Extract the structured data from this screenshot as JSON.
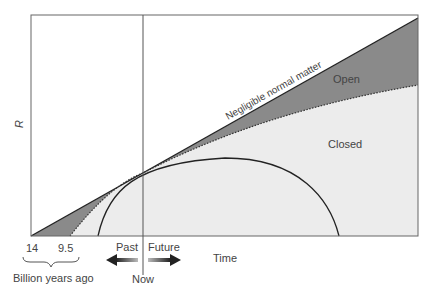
{
  "diagram": {
    "y_axis_label": "R",
    "x_axis_label": "Time",
    "tick_labels": [
      "14",
      "9.5"
    ],
    "brace_label": "Billion years ago",
    "now_label": "Now",
    "past_label": "Past",
    "future_label": "Future",
    "curves": {
      "empty": "Negligible normal matter",
      "open": "Open",
      "closed": "Closed"
    },
    "colors": {
      "open_fill": "#8a8a8a",
      "closed_fill": "#ececec",
      "line": "#222222",
      "frame": "#666666"
    }
  }
}
